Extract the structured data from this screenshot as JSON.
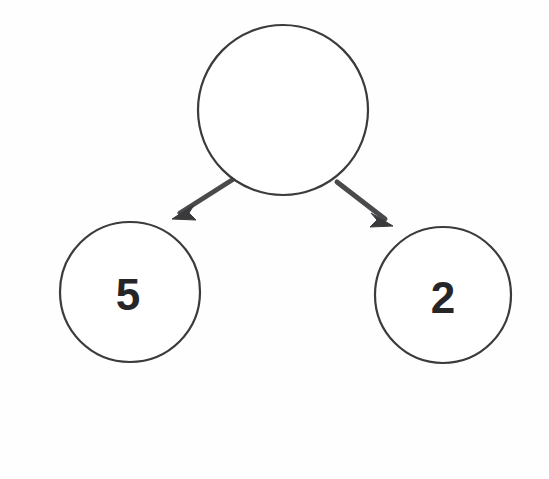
{
  "diagram": {
    "type": "number-bond",
    "background_color": "#fefefe",
    "stroke_color": "#3b3b3d",
    "text_color": "#262628",
    "arrow_color": "#4a4a4c",
    "nodes": [
      {
        "id": "whole",
        "role": "whole",
        "label": "",
        "cx": 283,
        "cy": 110,
        "r": 85,
        "stroke_width": 2.2,
        "font_size": 46
      },
      {
        "id": "part-left",
        "role": "part",
        "label": "5",
        "cx": 130,
        "cy": 292,
        "r": 70,
        "stroke_width": 2.2,
        "font_size": 44
      },
      {
        "id": "part-right",
        "role": "part",
        "label": "2",
        "cx": 443,
        "cy": 295,
        "r": 68,
        "stroke_width": 2.2,
        "font_size": 44
      }
    ],
    "arrows": [
      {
        "id": "arrow-to-left-part",
        "from": "whole",
        "to": "part-left",
        "x1": 232,
        "y1": 180,
        "x2": 174,
        "y2": 217,
        "stroke_width": 5,
        "head_size": 17
      },
      {
        "id": "arrow-to-right-part",
        "from": "whole",
        "to": "part-right",
        "x1": 337,
        "y1": 182,
        "x2": 391,
        "y2": 224,
        "stroke_width": 5,
        "head_size": 17
      }
    ]
  }
}
